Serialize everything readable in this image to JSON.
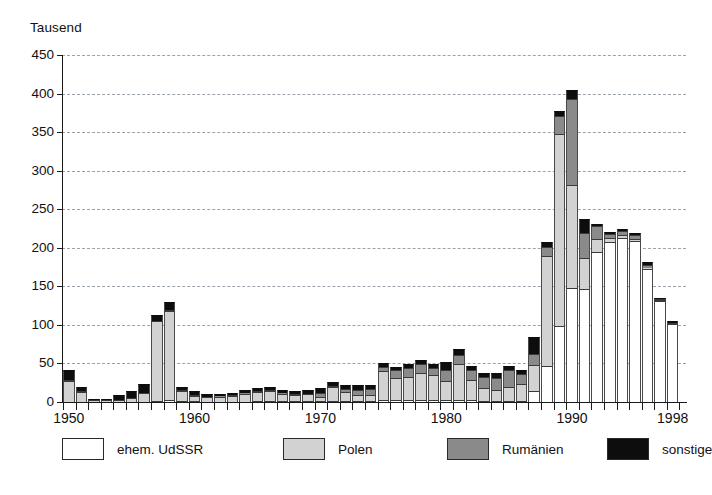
{
  "chart_data": {
    "type": "bar",
    "stacked": true,
    "title": "",
    "subtitle": "",
    "xlabel": "",
    "ylabel": "Tausend",
    "unit_label": "Tausend",
    "ylim": [
      0,
      450
    ],
    "yticks": [
      0,
      50,
      100,
      150,
      200,
      250,
      300,
      350,
      400,
      450
    ],
    "ytick_labels": [
      "0",
      "50",
      "100",
      "150",
      "200",
      "250",
      "300",
      "350",
      "400",
      "450"
    ],
    "grid": "horizontal-dashed",
    "legend_position": "bottom",
    "xlim": [
      1950,
      1998
    ],
    "xticks": [
      1950,
      1960,
      1970,
      1980,
      1990,
      1998
    ],
    "xtick_labels": [
      "1950",
      "1960",
      "1970",
      "1980",
      "1990",
      "1998"
    ],
    "x": [
      1950,
      1951,
      1952,
      1953,
      1954,
      1955,
      1956,
      1957,
      1958,
      1959,
      1960,
      1961,
      1962,
      1963,
      1964,
      1965,
      1966,
      1967,
      1968,
      1969,
      1970,
      1971,
      1972,
      1973,
      1974,
      1975,
      1976,
      1977,
      1978,
      1979,
      1980,
      1981,
      1982,
      1983,
      1984,
      1985,
      1986,
      1987,
      1988,
      1989,
      1990,
      1991,
      1992,
      1993,
      1994,
      1995,
      1996,
      1997,
      1998
    ],
    "categories": [
      "1950",
      "1951",
      "1952",
      "1953",
      "1954",
      "1955",
      "1956",
      "1957",
      "1958",
      "1959",
      "1960",
      "1961",
      "1962",
      "1963",
      "1964",
      "1965",
      "1966",
      "1967",
      "1968",
      "1969",
      "1970",
      "1971",
      "1972",
      "1973",
      "1974",
      "1975",
      "1976",
      "1977",
      "1978",
      "1979",
      "1980",
      "1981",
      "1982",
      "1983",
      "1984",
      "1985",
      "1986",
      "1987",
      "1988",
      "1989",
      "1990",
      "1991",
      "1992",
      "1993",
      "1994",
      "1995",
      "1996",
      "1997",
      "1998"
    ],
    "series": [
      {
        "name": "ehem. UdSSR",
        "color": "#ffffff",
        "values": [
          0,
          0,
          0,
          0,
          0,
          0,
          0,
          1,
          2,
          1,
          1,
          0,
          0,
          0,
          0,
          1,
          1,
          1,
          1,
          1,
          1,
          1,
          1,
          1,
          1,
          2,
          2,
          2,
          2,
          3,
          3,
          3,
          2,
          1,
          1,
          1,
          1,
          14,
          47,
          98,
          148,
          147,
          195,
          207,
          213,
          209,
          173,
          131,
          101
        ]
      },
      {
        "name": "Polen",
        "color": "#d2d2d2",
        "values": [
          27,
          13,
          3,
          2,
          3,
          5,
          12,
          104,
          116,
          13,
          7,
          6,
          7,
          8,
          11,
          12,
          13,
          10,
          8,
          9,
          5,
          18,
          12,
          8,
          8,
          38,
          29,
          31,
          35,
          32,
          24,
          46,
          26,
          17,
          14,
          19,
          22,
          34,
          142,
          250,
          134,
          40,
          17,
          6,
          3,
          2,
          1,
          1,
          1
        ]
      },
      {
        "name": "Rumänien",
        "color": "#8a8a8a",
        "values": [
          1,
          1,
          0,
          0,
          0,
          0,
          0,
          0,
          1,
          1,
          1,
          1,
          1,
          1,
          1,
          1,
          1,
          1,
          1,
          1,
          6,
          2,
          4,
          7,
          8,
          5,
          11,
          11,
          12,
          9,
          15,
          12,
          13,
          15,
          16,
          22,
          13,
          14,
          12,
          23,
          111,
          32,
          16,
          5,
          6,
          5,
          4,
          1,
          1
        ]
      },
      {
        "name": "sonstige",
        "color": "#0d0d0d",
        "values": [
          14,
          6,
          1,
          2,
          6,
          9,
          12,
          8,
          11,
          4,
          5,
          4,
          3,
          3,
          3,
          4,
          4,
          4,
          4,
          4,
          6,
          5,
          5,
          6,
          5,
          5,
          4,
          5,
          5,
          5,
          10,
          8,
          6,
          5,
          6,
          5,
          6,
          22,
          7,
          7,
          12,
          19,
          3,
          3,
          3,
          3,
          3,
          2,
          2
        ]
      }
    ]
  },
  "legend": {
    "items": [
      {
        "label": "ehem. UdSSR",
        "color": "#ffffff"
      },
      {
        "label": "Polen",
        "color": "#d2d2d2"
      },
      {
        "label": "Rumänien",
        "color": "#8a8a8a"
      },
      {
        "label": "sonstige",
        "color": "#0d0d0d"
      }
    ]
  },
  "colors": {
    "axis": "#1a1a1a",
    "grid": "#9aa3ab",
    "background": "#ffffff",
    "udssr": "#ffffff",
    "polen": "#d2d2d2",
    "rumaenien": "#8a8a8a",
    "sonstige": "#0d0d0d"
  }
}
